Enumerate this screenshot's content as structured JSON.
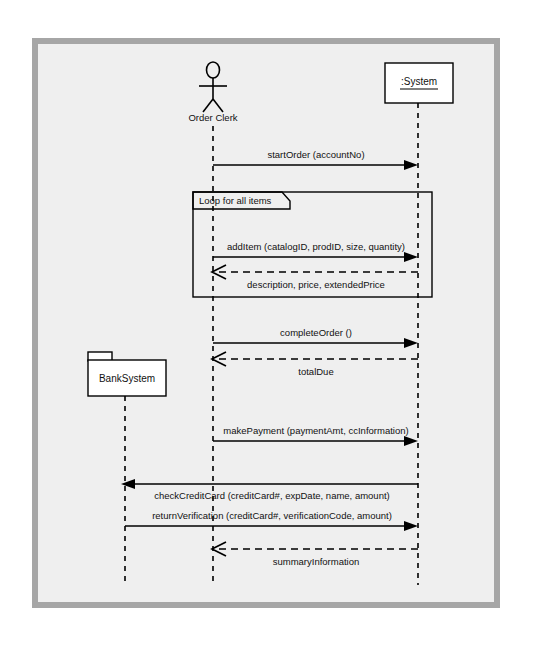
{
  "diagram": {
    "kind": "uml-sequence-diagram",
    "canvas": {
      "width": 546,
      "height": 646,
      "background": "#ffffff",
      "frame_border_color": "#a6a6a6",
      "frame_fill": "#efefef"
    },
    "participants": [
      {
        "id": "orderClerk",
        "label": "Order Clerk",
        "type": "actor",
        "x": 213,
        "label_y": 117,
        "lifeline_top": 124,
        "lifeline_bottom": 585
      },
      {
        "id": "system",
        "label": ":System",
        "type": "object-box",
        "x": 418,
        "box_x": 385,
        "box_y": 63,
        "box_width": 68,
        "box_height": 40,
        "lifeline_top": 103,
        "lifeline_bottom": 585
      },
      {
        "id": "bankSystem",
        "label": "BankSystem",
        "type": "package",
        "x": 125,
        "box_x": 88,
        "box_y": 352,
        "box_width": 78,
        "box_height": 44,
        "tab_width": 22,
        "tab_height": 8,
        "lifeline_top": 396,
        "lifeline_bottom": 585
      }
    ],
    "fragment": {
      "label": "Loop for all items",
      "type": "loop",
      "x": 193,
      "y": 192,
      "width": 239,
      "height": 105,
      "tab_width": 97,
      "tab_height": 17
    },
    "messages": [
      {
        "text": "startOrder (accountNo)",
        "from": "orderClerk",
        "to": "system",
        "y": 165,
        "style": "solid",
        "arrow": "filled",
        "direction": "right",
        "label_pos": "above"
      },
      {
        "text": "addItem (catalogID, prodID, size, quantity)",
        "from": "orderClerk",
        "to": "system",
        "y": 257,
        "style": "solid",
        "arrow": "filled",
        "direction": "right",
        "label_pos": "above"
      },
      {
        "text": "description, price, extendedPrice",
        "from": "system",
        "to": "orderClerk",
        "y": 272,
        "style": "dashed",
        "arrow": "open",
        "direction": "left",
        "label_pos": "below"
      },
      {
        "text": "completeOrder ()",
        "from": "orderClerk",
        "to": "system",
        "y": 343,
        "style": "solid",
        "arrow": "filled",
        "direction": "right",
        "label_pos": "above"
      },
      {
        "text": "totalDue",
        "from": "system",
        "to": "orderClerk",
        "y": 359,
        "style": "dashed",
        "arrow": "open",
        "direction": "left",
        "label_pos": "below"
      },
      {
        "text": "makePayment (paymentAmt, ccInformation)",
        "from": "orderClerk",
        "to": "system",
        "y": 441,
        "style": "solid",
        "arrow": "filled",
        "direction": "right",
        "label_pos": "above"
      },
      {
        "text": "checkCreditCard (creditCard#, expDate, name, amount)",
        "from": "system",
        "to": "bankSystem",
        "y": 484,
        "style": "solid",
        "arrow": "filled",
        "direction": "left",
        "label_pos": "below"
      },
      {
        "text": "returnVerification (creditCard#, verificationCode, amount)",
        "from": "bankSystem",
        "to": "system",
        "y": 526,
        "style": "solid",
        "arrow": "filled",
        "direction": "right",
        "label_pos": "above"
      },
      {
        "text": "summaryInformation",
        "from": "system",
        "to": "orderClerk",
        "y": 549,
        "style": "dashed",
        "arrow": "open",
        "direction": "left",
        "label_pos": "below"
      }
    ]
  }
}
